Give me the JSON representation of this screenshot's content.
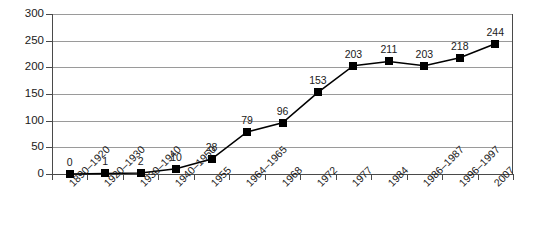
{
  "chart_data": {
    "type": "line",
    "title": "",
    "subtitle": "",
    "xlabel": "",
    "ylabel": "",
    "ylim": [
      0,
      300
    ],
    "ytick_step": 50,
    "yticks": [
      "0",
      "50",
      "100",
      "150",
      "200",
      "250",
      "300"
    ],
    "grid": true,
    "legend": false,
    "legend_position": "none",
    "marker": "square",
    "marker_color": "#000000",
    "line_color": "#000000",
    "grid_color": "#9a9a9a",
    "axis_color": "#4a4a4a",
    "show_data_labels": true,
    "categories": [
      "1890–1920",
      "1920–1930",
      "1930–1940",
      "1940–1950",
      "1955",
      "1964–1965",
      "1968",
      "1972",
      "1977",
      "1984",
      "1986–1987",
      "1996–1997",
      "2007"
    ],
    "values": [
      0,
      1,
      2,
      10,
      28,
      79,
      96,
      153,
      203,
      211,
      203,
      218,
      244
    ],
    "data_labels": [
      "0",
      "1",
      "2",
      "10",
      "28",
      "79",
      "96",
      "153",
      "203",
      "211",
      "203",
      "218",
      "244"
    ]
  }
}
